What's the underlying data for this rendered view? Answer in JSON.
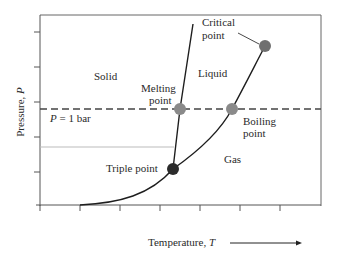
{
  "diagram": {
    "axes": {
      "x_label": "Temperature, ",
      "x_symbol": "T",
      "y_label": "Pressure, ",
      "y_symbol": "P"
    },
    "regions": {
      "solid": "Solid",
      "liquid": "Liquid",
      "gas": "Gas"
    },
    "reference_line": {
      "label_symbol": "P",
      "label_rest": " = 1 bar"
    },
    "points": {
      "critical": {
        "line1": "Critical",
        "line2": "point",
        "color": "#6f6f6f"
      },
      "melting": {
        "line1": "Melting",
        "line2": "point",
        "color": "#8a8a8a"
      },
      "boiling": {
        "line1": "Boiling",
        "line2": "point",
        "color": "#8a8a8a"
      },
      "triple": {
        "label": "Triple point",
        "color": "#2b2b2b"
      }
    },
    "colors": {
      "axis": "#555555",
      "curve": "#1e1e1e",
      "dashed": "#444444",
      "dotted": "#bbbbbb"
    }
  }
}
